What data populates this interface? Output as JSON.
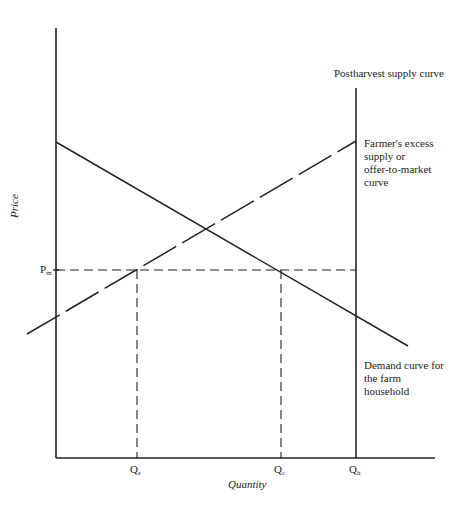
{
  "diagram": {
    "title": "",
    "axes": {
      "x_label": "Quantity",
      "y_label": "Price"
    },
    "price_label": {
      "main": "P",
      "sub": "m"
    },
    "quantity_ticks": [
      {
        "main": "Q",
        "sub": "s"
      },
      {
        "main": "Q",
        "sub": "c"
      },
      {
        "main": "Q",
        "sub": "h"
      }
    ],
    "curves": {
      "postharvest_supply": "Postharvest supply curve",
      "excess_supply_line1": "Farmer's excess",
      "excess_supply_line2": "supply or",
      "excess_supply_line3": "offer-to-market",
      "excess_supply_line4": "curve",
      "demand_line1": "Demand curve for",
      "demand_line2": "the farm",
      "demand_line3": "household"
    },
    "colors": {
      "line": "#222222",
      "background": "#ffffff"
    }
  }
}
